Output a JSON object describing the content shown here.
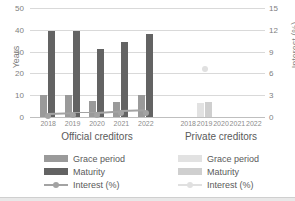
{
  "chart_data": {
    "type": "bar",
    "title": "",
    "subtitle": "",
    "xlabel": "",
    "ylabel": "Years",
    "y2label": "Interest (%)",
    "ylim": [
      0,
      50
    ],
    "y2lim": [
      0,
      15
    ],
    "yticks": [
      0,
      10,
      20,
      30,
      40,
      50
    ],
    "y2ticks": [
      0,
      3,
      6,
      9,
      12,
      15
    ],
    "grid": true,
    "legend_position": "bottom",
    "groups": [
      {
        "name": "Official creditors",
        "categories": [
          "2018",
          "2019",
          "2020",
          "2021",
          "2022"
        ],
        "series": [
          {
            "name": "Grace period",
            "axis": "left",
            "type": "bar",
            "values": [
              10,
              10,
              7.5,
              7,
              10
            ]
          },
          {
            "name": "Maturity",
            "axis": "left",
            "type": "bar",
            "values": [
              39.5,
              39.3,
              31,
              34.2,
              38
            ]
          },
          {
            "name": "Interest (%)",
            "axis": "right",
            "type": "line",
            "values": [
              0.6,
              0.7,
              0.7,
              0.9,
              1.0
            ]
          }
        ]
      },
      {
        "name": "Private creditors",
        "categories": [
          "2018",
          "2019",
          "2020",
          "2021",
          "2022"
        ],
        "series": [
          {
            "name": "Grace period",
            "axis": "left",
            "type": "bar",
            "values": [
              null,
              6.3,
              null,
              null,
              null
            ]
          },
          {
            "name": "Maturity",
            "axis": "left",
            "type": "bar",
            "values": [
              null,
              7.0,
              null,
              null,
              null
            ]
          },
          {
            "name": "Interest (%)",
            "axis": "right",
            "type": "line",
            "values": [
              null,
              7.0,
              null,
              null,
              null
            ]
          }
        ]
      }
    ]
  },
  "axes": {
    "left": {
      "label": "Years",
      "ticks": [
        "50",
        "40",
        "30",
        "20",
        "10",
        "0"
      ]
    },
    "right": {
      "label": "Interest (%)",
      "ticks": [
        "15",
        "12",
        "9",
        "6",
        "3",
        "0"
      ]
    }
  },
  "groups": [
    {
      "title": "Official creditors",
      "ticks": [
        "2018",
        "2019",
        "2020",
        "2021",
        "2022"
      ]
    },
    {
      "title": "Private creditors",
      "ticks": [
        "2018",
        "2019",
        "2020",
        "2021",
        "2022"
      ]
    }
  ],
  "legend": {
    "official": [
      {
        "label": "Grace period",
        "marker": "swatch",
        "color": "#9a9a9a"
      },
      {
        "label": "Maturity",
        "marker": "swatch",
        "color": "#636363"
      },
      {
        "label": "Interest (%)",
        "marker": "line-marker",
        "color": "#a3a3a3"
      }
    ],
    "private": [
      {
        "label": "Grace period",
        "marker": "swatch",
        "color": "#e2e2e2"
      },
      {
        "label": "Maturity",
        "marker": "swatch",
        "color": "#cfcfcf"
      },
      {
        "label": "Interest (%)",
        "marker": "line-marker",
        "color": "#e0e0e0"
      }
    ]
  },
  "colors": {
    "grace_official": "#9a9a9a",
    "maturity_official": "#636363",
    "interest_official": "#a3a3a3",
    "grace_private": "#e2e2e2",
    "maturity_private": "#cfcfcf",
    "interest_private": "#e0e0e0",
    "gridline": "#d9d9d9",
    "tick_text": "#808080",
    "title_text": "#5a5a5a"
  }
}
